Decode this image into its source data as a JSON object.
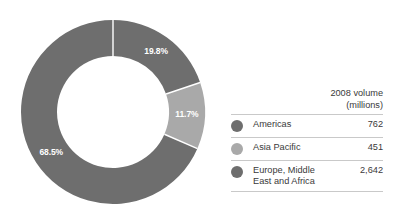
{
  "chart_data": {
    "type": "pie",
    "variant": "donut",
    "title": "",
    "subtitle": "",
    "categories": [
      "Americas",
      "Asia Pacific",
      "Europe, Middle East and Africa"
    ],
    "values": [
      762,
      451,
      2642
    ],
    "percentages": [
      19.8,
      11.7,
      68.5
    ],
    "value_labels": [
      "762",
      "451",
      "2,642"
    ],
    "percent_labels": [
      "19.8%",
      "11.7%",
      "68.5%"
    ],
    "unit": "millions",
    "value_header": "2008 volume (millions)",
    "colors": [
      "#6e6e6e",
      "#a9a9a9",
      "#6e6e6e"
    ],
    "label_color": "#ffffff",
    "separator_color": "#ffffff",
    "start_angle_deg": 0,
    "direction": "clockwise",
    "legend": {
      "position": "right",
      "header_line1": "2008 volume",
      "header_line2": "(millions)",
      "rows": [
        {
          "label": "Americas",
          "label_line1": "Americas",
          "label_line2": "",
          "value": "762",
          "color": "#6e6e6e"
        },
        {
          "label": "Asia Pacific",
          "label_line1": "Asia Pacific",
          "label_line2": "",
          "value": "451",
          "color": "#a9a9a9"
        },
        {
          "label": "Europe, Middle East and Africa",
          "label_line1": "Europe, Middle",
          "label_line2": "East and Africa",
          "value": "2,642",
          "color": "#6e6e6e"
        }
      ]
    },
    "grid": false,
    "xlabel": "",
    "ylabel": ""
  },
  "donut": {
    "slices": [
      {
        "name": "americas",
        "percent_label": "19.8%",
        "color": "#6e6e6e"
      },
      {
        "name": "asia-pacific",
        "percent_label": "11.7%",
        "color": "#a9a9a9"
      },
      {
        "name": "emea",
        "percent_label": "68.5%",
        "color": "#6e6e6e"
      }
    ]
  }
}
